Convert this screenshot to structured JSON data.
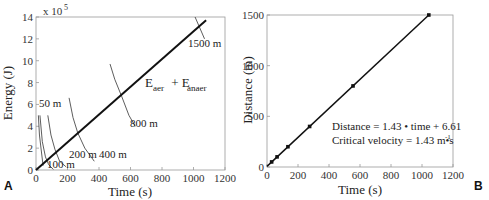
{
  "chart_data": [
    {
      "panel": "A",
      "type": "line",
      "xlabel": "Time (s)",
      "ylabel": "Energy (J)",
      "y_multiplier": "x 10",
      "y_multiplier_exp": "5",
      "xlim": [
        0,
        1200
      ],
      "ylim": [
        0,
        14
      ],
      "xticks": [
        0,
        200,
        400,
        600,
        800,
        1000,
        1200
      ],
      "yticks": [
        0,
        2,
        4,
        6,
        8,
        10,
        12,
        14
      ],
      "main_line": {
        "name": "E_aer + E_anaer",
        "label_main": "E",
        "label_sub1": "aer",
        "label_plus": " + E",
        "label_sub2": "anaer",
        "x": [
          0,
          1080
        ],
        "y": [
          0,
          13.7
        ]
      },
      "curves": [
        {
          "name": "50 m",
          "x": [
            15,
            22,
            30,
            45
          ],
          "y": [
            5.0,
            3.2,
            2.2,
            0.4
          ]
        },
        {
          "name": "100 m",
          "x": [
            25,
            40,
            60,
            80,
            110
          ],
          "y": [
            5.0,
            2.6,
            1.2,
            0.5,
            0.05
          ]
        },
        {
          "name": "200 m",
          "x": [
            75,
            95,
            120,
            150,
            190
          ],
          "y": [
            5.0,
            3.2,
            1.9,
            0.8,
            0.3
          ]
        },
        {
          "name": "400 m",
          "x": [
            210,
            235,
            265,
            310,
            370
          ],
          "y": [
            6.6,
            4.8,
            3.4,
            2.0,
            0.8
          ]
        },
        {
          "name": "800 m",
          "x": [
            470,
            500,
            545,
            590,
            630
          ],
          "y": [
            9.7,
            8.3,
            6.7,
            5.0,
            4.0
          ]
        },
        {
          "name": "1500 m",
          "x": [
            1010,
            1040,
            1070
          ],
          "y": [
            14.0,
            13.0,
            12.0
          ]
        }
      ],
      "labels": [
        "50 m",
        "100 m",
        "200 m",
        "400 m",
        "800 m",
        "1500 m"
      ]
    },
    {
      "panel": "B",
      "type": "line",
      "xlabel": "Time (s)",
      "ylabel": "Distance (m)",
      "xlim": [
        0,
        1200
      ],
      "ylim": [
        0,
        1500
      ],
      "xticks": [
        0,
        200,
        400,
        600,
        800,
        1000,
        1200
      ],
      "yticks": [
        0,
        500,
        1000,
        1500
      ],
      "points": {
        "x": [
          30,
          65,
          135,
          275,
          555,
          1044
        ],
        "y": [
          50,
          100,
          200,
          400,
          800,
          1500
        ]
      },
      "fit": {
        "slope": 1.43,
        "intercept": 6.61
      },
      "annotation_line1": "Distance = 1.43 • time + 6.61",
      "annotation_line2": "Critical velocity = 1.43 m•s",
      "annotation_line2_exp": "-1"
    }
  ]
}
